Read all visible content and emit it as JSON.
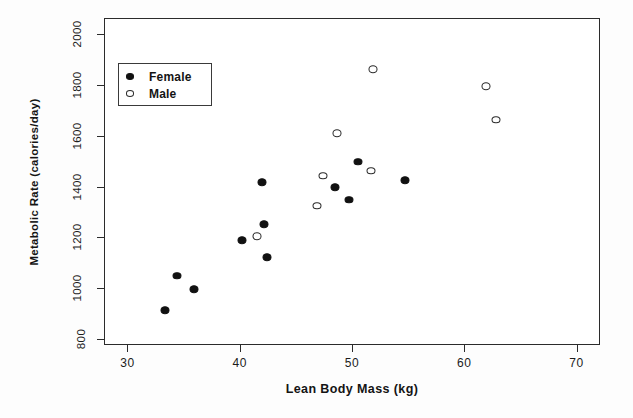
{
  "chart_data": {
    "type": "scatter",
    "title": "",
    "xlabel": "Lean Body Mass (kg)",
    "ylabel": "Metabolic Rate (calories/day)",
    "xlim": [
      28,
      72
    ],
    "ylim": [
      780,
      2060
    ],
    "xticks": [
      30,
      40,
      50,
      60,
      70
    ],
    "yticks": [
      800,
      1000,
      1200,
      1400,
      1600,
      1800,
      2000
    ],
    "grid": false,
    "legend_position": "upper left",
    "series": [
      {
        "name": "Female",
        "marker": "filled-circle",
        "color": "#111111",
        "points": [
          {
            "x": 33.3,
            "y": 912
          },
          {
            "x": 34.4,
            "y": 1048
          },
          {
            "x": 35.9,
            "y": 995
          },
          {
            "x": 40.2,
            "y": 1188
          },
          {
            "x": 42.0,
            "y": 1418
          },
          {
            "x": 42.2,
            "y": 1252
          },
          {
            "x": 42.4,
            "y": 1122
          },
          {
            "x": 48.5,
            "y": 1397
          },
          {
            "x": 49.7,
            "y": 1348
          },
          {
            "x": 50.5,
            "y": 1498
          },
          {
            "x": 54.7,
            "y": 1425
          }
        ]
      },
      {
        "name": "Male",
        "marker": "open-circle",
        "color": "#2a2a2a",
        "points": [
          {
            "x": 41.5,
            "y": 1204
          },
          {
            "x": 46.9,
            "y": 1325
          },
          {
            "x": 47.4,
            "y": 1443
          },
          {
            "x": 48.7,
            "y": 1610
          },
          {
            "x": 51.7,
            "y": 1462
          },
          {
            "x": 51.9,
            "y": 1862
          },
          {
            "x": 61.9,
            "y": 1796
          },
          {
            "x": 62.8,
            "y": 1663
          }
        ]
      }
    ]
  },
  "axes": {
    "x_title": "Lean Body Mass (kg)",
    "y_title": "Metabolic Rate (calories/day)",
    "x_tick_labels": [
      "30",
      "40",
      "50",
      "60",
      "70"
    ],
    "y_tick_labels": [
      "800",
      "1000",
      "1200",
      "1400",
      "1600",
      "1800",
      "2000"
    ]
  },
  "legend": {
    "entries": [
      {
        "label": "Female",
        "marker": "filled-circle"
      },
      {
        "label": "Male",
        "marker": "open-circle"
      }
    ]
  }
}
